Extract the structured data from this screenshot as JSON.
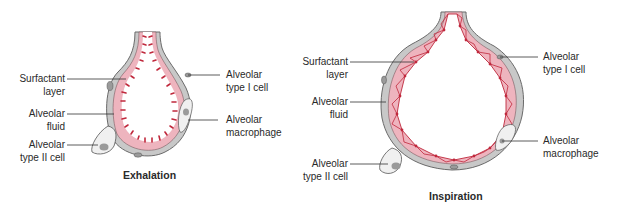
{
  "panels": [
    {
      "caption": "Exhalation",
      "labels": {
        "surfactant_l1": "Surfactant",
        "surfactant_l2": "layer",
        "fluid_l1": "Alveolar",
        "fluid_l2": "fluid",
        "type2_l1": "Alveolar",
        "type2_l2": "type II cell",
        "type1_l1": "Alveolar",
        "type1_l2": "type I cell",
        "macro_l1": "Alveolar",
        "macro_l2": "macrophage"
      }
    },
    {
      "caption": "Inspiration",
      "labels": {
        "surfactant_l1": "Surfactant",
        "surfactant_l2": "layer",
        "fluid_l1": "Alveolar",
        "fluid_l2": "fluid",
        "type2_l1": "Alveolar",
        "type2_l2": "type II cell",
        "type1_l1": "Alveolar",
        "type1_l2": "type I cell",
        "macro_l1": "Alveolar",
        "macro_l2": "macrophage"
      }
    }
  ],
  "colors": {
    "wall": "#c8c8c8",
    "wall_edge": "#6a6a6a",
    "fluid": "#eeb4be",
    "surfactant": "#c0283c",
    "cell": "#f0f0f0",
    "nucleus": "#9a9a9a"
  }
}
